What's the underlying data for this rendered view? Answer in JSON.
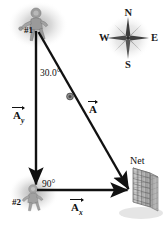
{
  "figure": {
    "background": "#ffffff"
  },
  "labels": {
    "player_one": "#1",
    "player_two": "#2",
    "angle_top": "30.0°",
    "angle_bottom": "90°",
    "net": "Net"
  },
  "vectors": {
    "resultant": {
      "symbol": "A",
      "subscript": ""
    },
    "vertical": {
      "symbol": "A",
      "subscript": "y"
    },
    "horizontal": {
      "symbol": "A",
      "subscript": "x"
    }
  },
  "compass": {
    "north": "N",
    "east": "E",
    "south": "S",
    "west": "W",
    "icon": "compass-rose-icon"
  },
  "colors": {
    "ink": "#111111",
    "line": "#1a1a1a",
    "net_fill": "#b9b9b9",
    "net_grid": "#6e6e6e",
    "glow": "#c9c9c9"
  },
  "geometry": {
    "apex": [
      36,
      31
    ],
    "corner": [
      36,
      186
    ],
    "net_point": [
      130,
      190
    ],
    "ball_on_path": [
      70,
      96
    ]
  }
}
